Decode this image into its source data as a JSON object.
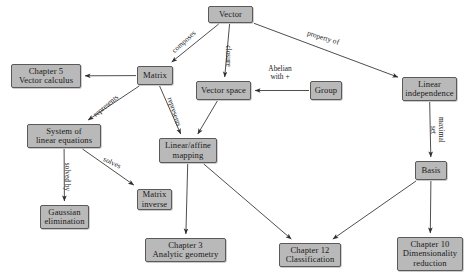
{
  "diagram": {
    "colors": {
      "node_fill": "#b9b9b9",
      "node_border": "#5a5a5a",
      "edge": "#3a3a3a",
      "background": "#ffffff",
      "text": "#1a1a1a"
    },
    "nodes": [
      {
        "id": "vector",
        "label": "Vector",
        "x": 208,
        "y": 6,
        "w": 45,
        "h": 17
      },
      {
        "id": "matrix",
        "label": "Matrix",
        "x": 137,
        "y": 66,
        "w": 36,
        "h": 19
      },
      {
        "id": "chapter5",
        "label": "Chapter 5\nVector calculus",
        "x": 11,
        "y": 64,
        "w": 70,
        "h": 24
      },
      {
        "id": "vector-space",
        "label": "Vector space",
        "x": 196,
        "y": 81,
        "w": 55,
        "h": 19
      },
      {
        "id": "group",
        "label": "Group",
        "x": 310,
        "y": 81,
        "w": 32,
        "h": 19
      },
      {
        "id": "linear-independence",
        "label": "Linear\nindependence",
        "x": 402,
        "y": 77,
        "w": 55,
        "h": 24
      },
      {
        "id": "system-linear-eq",
        "label": "System of\nlinear equations",
        "x": 27,
        "y": 124,
        "w": 74,
        "h": 24
      },
      {
        "id": "linear-affine",
        "label": "Linear/affine\nmapping",
        "x": 159,
        "y": 138,
        "w": 58,
        "h": 25
      },
      {
        "id": "gaussian-elimination",
        "label": "Gaussian\nelimination",
        "x": 40,
        "y": 205,
        "w": 49,
        "h": 24
      },
      {
        "id": "matrix-inverse",
        "label": "Matrix\ninverse",
        "x": 137,
        "y": 189,
        "w": 35,
        "h": 21
      },
      {
        "id": "basis",
        "label": "Basis",
        "x": 415,
        "y": 161,
        "w": 32,
        "h": 19
      },
      {
        "id": "chapter3",
        "label": "Chapter 3\nAnalytic geometry",
        "x": 145,
        "y": 238,
        "w": 81,
        "h": 24
      },
      {
        "id": "chapter12",
        "label": "Chapter 12\nClassification",
        "x": 279,
        "y": 243,
        "w": 62,
        "h": 24
      },
      {
        "id": "chapter10",
        "label": "Chapter 10\nDimensionality\nreduction",
        "x": 397,
        "y": 237,
        "w": 66,
        "h": 34
      }
    ],
    "edges": [
      {
        "id": "vector-to-matrix",
        "from": "vector",
        "to": "matrix",
        "label": "composes",
        "label_x": 184,
        "label_y": 42,
        "rotate": -42
      },
      {
        "id": "vector-to-vector-space",
        "from": "vector",
        "to": "vector-space",
        "label": "closure",
        "label_x": 228,
        "label_y": 56,
        "rotate": 90
      },
      {
        "id": "vector-to-linear-independence",
        "from": "vector",
        "to": "linear-independence",
        "label": "property of",
        "label_x": 323,
        "label_y": 38,
        "rotate": 17
      },
      {
        "id": "matrix-to-chapter5",
        "from": "matrix",
        "to": "chapter5",
        "label": "",
        "label_x": 0,
        "label_y": 0,
        "rotate": 0
      },
      {
        "id": "matrix-to-system-linear-eq",
        "from": "matrix",
        "to": "system-linear-eq",
        "label": "represents",
        "label_x": 106,
        "label_y": 106,
        "rotate": -40
      },
      {
        "id": "matrix-to-linear-affine",
        "from": "matrix",
        "to": "linear-affine",
        "label": "represents",
        "label_x": 174,
        "label_y": 112,
        "rotate": 72
      },
      {
        "id": "group-to-vector-space",
        "from": "group",
        "to": "vector-space",
        "label": "Abelian\nwith +",
        "label_x": 280,
        "label_y": 73,
        "rotate": 0
      },
      {
        "id": "vector-space-to-linear-affine",
        "from": "vector-space",
        "to": "linear-affine",
        "label": "",
        "label_x": 0,
        "label_y": 0,
        "rotate": 0
      },
      {
        "id": "system-to-gaussian-elimination",
        "from": "system-linear-eq",
        "to": "gaussian-elimination",
        "label": "solved by",
        "label_x": 67,
        "label_y": 177,
        "rotate": 90
      },
      {
        "id": "system-to-matrix-inverse",
        "from": "system-linear-eq",
        "to": "matrix-inverse",
        "label": "solves",
        "label_x": 112,
        "label_y": 163,
        "rotate": 25
      },
      {
        "id": "linear-affine-to-chapter3",
        "from": "linear-affine",
        "to": "chapter3",
        "label": "",
        "label_x": 0,
        "label_y": 0,
        "rotate": 0
      },
      {
        "id": "linear-affine-to-chapter12",
        "from": "linear-affine",
        "to": "chapter12",
        "label": "",
        "label_x": 0,
        "label_y": 0,
        "rotate": 0
      },
      {
        "id": "linear-independence-to-basis",
        "from": "linear-independence",
        "to": "basis",
        "label": "maximal set",
        "label_x": 437,
        "label_y": 130,
        "rotate": 90
      },
      {
        "id": "basis-to-chapter12",
        "from": "basis",
        "to": "chapter12",
        "label": "",
        "label_x": 0,
        "label_y": 0,
        "rotate": 0
      },
      {
        "id": "basis-to-chapter10",
        "from": "basis",
        "to": "chapter10",
        "label": "",
        "label_x": 0,
        "label_y": 0,
        "rotate": 0
      }
    ]
  }
}
